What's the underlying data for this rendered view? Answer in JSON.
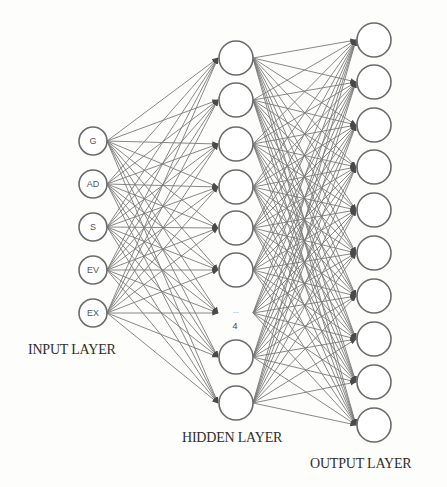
{
  "diagram": {
    "type": "neural-network",
    "layers": {
      "input": {
        "label": "INPUT LAYER",
        "nodes": [
          "G",
          "AD",
          "S",
          "EV",
          "EX"
        ]
      },
      "hidden": {
        "label": "HIDDEN LAYER",
        "visible_nodes": 8,
        "ellipsis": "...",
        "ellipsis_annotation": "4"
      },
      "output": {
        "label": "OUTPUT LAYER",
        "visible_nodes": 10
      }
    },
    "connectivity": "fully-connected with arrowheads",
    "colors": {
      "node_stroke": "#6b6b6b",
      "edge": "#7a7a7a",
      "text": "#2e2e2e",
      "background": "#fdfdfc"
    }
  }
}
